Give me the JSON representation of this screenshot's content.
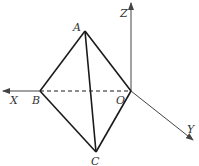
{
  "diagram": {
    "type": "3d-coordinate-geometry",
    "axes": {
      "x_label": "X",
      "y_label": "Y",
      "z_label": "Z"
    },
    "points": {
      "A": "A",
      "B": "B",
      "C": "C",
      "O": "O"
    },
    "edges": [
      {
        "from": "A",
        "to": "B",
        "style": "solid"
      },
      {
        "from": "A",
        "to": "O",
        "style": "solid"
      },
      {
        "from": "A",
        "to": "C",
        "style": "solid"
      },
      {
        "from": "B",
        "to": "C",
        "style": "solid"
      },
      {
        "from": "O",
        "to": "C",
        "style": "solid"
      },
      {
        "from": "B",
        "to": "O",
        "style": "dashed"
      }
    ],
    "colors": {
      "edge": "#1a1a1a",
      "axis": "#444444"
    }
  }
}
